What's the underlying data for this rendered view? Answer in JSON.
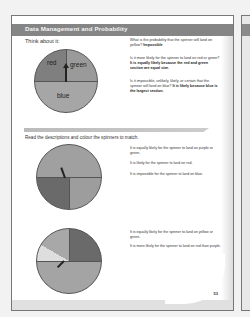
{
  "header": {
    "title": "Data Management and Probability"
  },
  "section1": {
    "prompt": "Think about it:",
    "spinner": {
      "sections": [
        {
          "label": "red",
          "fraction": 0.25,
          "color": "#7a7a7a"
        },
        {
          "label": "green",
          "fraction": 0.25,
          "color": "#9a9a9a"
        },
        {
          "label": "blue",
          "fraction": 0.5,
          "color": "#a8a8a8"
        }
      ]
    },
    "questions": [
      {
        "text": "What is the probability that the spinner will land on yellow?",
        "answer": "Impossible"
      },
      {
        "text": "Is it more likely for the spinner to land on red or green?",
        "answer": "It is equally likely because the red and green section are equal size."
      },
      {
        "text": "Is it impossible, unlikely, likely, or certain that the spinner will land on blue?",
        "answer": "It is likely because blue is the largest section."
      }
    ]
  },
  "section2": {
    "instruction": "Read the descriptions and colour the spinners to match.",
    "spinner1": {
      "statements": [
        "It is equally likely for the spinner to land on purple or green.",
        "It is likely for the spinner to land on red.",
        "It is impossible for the spinner to land on blue."
      ]
    },
    "spinner2": {
      "statements": [
        "It is equally likely for the spinner to land on yellow or green.",
        "It is more likely for the spinner to land on red than purple."
      ]
    }
  },
  "footer": {
    "page_number": "53"
  }
}
